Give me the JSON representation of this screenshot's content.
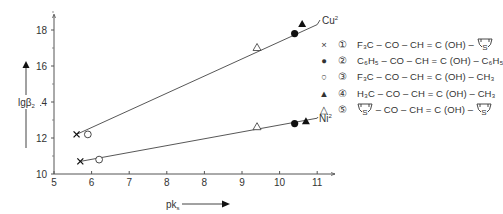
{
  "chart_data": {
    "type": "scatter",
    "title": "",
    "xlabel": "pk_s",
    "ylabel": "lgβ2",
    "xlim": [
      5,
      11.5
    ],
    "ylim": [
      10,
      19
    ],
    "x_tick_labels": [
      "5",
      "6",
      "7",
      "8",
      "8",
      "9",
      "10",
      "11"
    ],
    "y_tick_labels": [
      "10",
      "12",
      "14",
      "16",
      "18"
    ],
    "grid": false,
    "legend_position": "right",
    "lines": [
      {
        "name": "Cu2+",
        "label": "Cu²",
        "x": [
          5.6,
          11.0
        ],
        "y": [
          12.2,
          18.3
        ]
      },
      {
        "name": "Ni2+",
        "label": "Ni²",
        "x": [
          5.7,
          11.0
        ],
        "y": [
          10.7,
          13.1
        ]
      }
    ],
    "series": [
      {
        "name": "1",
        "marker": "x",
        "formula": "F3C-CO-CH=C(OH)-thienyl",
        "points": [
          {
            "x": 5.6,
            "y": 12.2,
            "metal": "Cu"
          },
          {
            "x": 5.7,
            "y": 10.7,
            "metal": "Ni"
          }
        ]
      },
      {
        "name": "2",
        "marker": "filled-circle",
        "formula": "C6H5-CO-CH=C(OH)-C6H5",
        "points": [
          {
            "x": 10.4,
            "y": 17.8,
            "metal": "Cu"
          },
          {
            "x": 10.4,
            "y": 12.8,
            "metal": "Ni"
          }
        ]
      },
      {
        "name": "3",
        "marker": "open-circle",
        "formula": "F3C-CO-CH=C(OH)-CH3",
        "points": [
          {
            "x": 5.9,
            "y": 12.2,
            "metal": "Cu"
          },
          {
            "x": 6.2,
            "y": 10.8,
            "metal": "Ni"
          }
        ]
      },
      {
        "name": "4",
        "marker": "filled-triangle",
        "formula": "H3C-CO-CH=C(OH)-CH3",
        "points": [
          {
            "x": 10.6,
            "y": 18.3,
            "metal": "Cu"
          },
          {
            "x": 10.7,
            "y": 12.9,
            "metal": "Ni"
          }
        ]
      },
      {
        "name": "5",
        "marker": "open-triangle",
        "formula": "thienyl-CO-CH=C(OH)-thienyl",
        "points": [
          {
            "x": 9.4,
            "y": 17.0,
            "metal": "Cu"
          },
          {
            "x": 9.4,
            "y": 12.6,
            "metal": "Ni"
          }
        ]
      }
    ]
  },
  "axes": {
    "ylabel_main": "lgβ",
    "ylabel_sub": "2",
    "xlabel_main": "pk",
    "xlabel_sub": "s"
  },
  "line_labels": {
    "cu": "Cu",
    "cu_sup": "2",
    "ni": "Ni",
    "ni_sup": "2"
  },
  "legend": [
    {
      "marker": "×",
      "num": "①",
      "formula": "F₃C – CO – CH = C (OH) – ",
      "suffix_ring": true,
      "prefix_ring": false
    },
    {
      "marker": "●",
      "num": "②",
      "formula": "C₆H₅ – CO – CH = C (OH) – C₆H₅",
      "suffix_ring": false,
      "prefix_ring": false
    },
    {
      "marker": "○",
      "num": "③",
      "formula": "F₃C – CO – CH = C (OH) – CH₃",
      "suffix_ring": false,
      "prefix_ring": false
    },
    {
      "marker": "▲",
      "num": "④",
      "formula": "H₃C – CO – CH = C (OH) – CH₃",
      "suffix_ring": false,
      "prefix_ring": false
    },
    {
      "marker": "△",
      "num": "⑤",
      "formula": " – CO – CH = C (OH) – ",
      "suffix_ring": true,
      "prefix_ring": true
    }
  ],
  "ring_label": "S"
}
